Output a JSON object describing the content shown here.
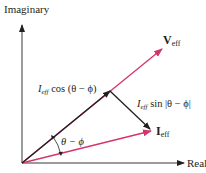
{
  "diagram": {
    "axes": {
      "vertical_label": "Imaginary",
      "horizontal_label": "Real"
    },
    "vectors": {
      "voltage": {
        "symbol": "V",
        "subscript": "eff",
        "color": "#d6336c"
      },
      "current": {
        "symbol": "I",
        "subscript": "eff",
        "color": "#d6336c"
      },
      "projection": {
        "color": "#231f20"
      },
      "perpendicular": {
        "color": "#231f20"
      }
    },
    "labels": {
      "cos_component": {
        "symbol": "I",
        "subscript": "eff",
        "text": " cos (θ − ϕ)"
      },
      "sin_component": {
        "symbol": "I",
        "subscript": "eff",
        "text": " sin |θ − ϕ|"
      },
      "angle": "θ − ϕ"
    },
    "colors": {
      "axis": "#231f20",
      "phasor": "#d6336c",
      "component": "#231f20"
    }
  }
}
